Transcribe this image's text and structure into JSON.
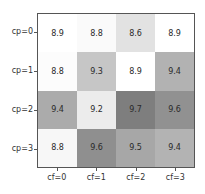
{
  "chart_data": {
    "type": "heatmap",
    "title": "",
    "xlabel": "",
    "ylabel": "",
    "x_categories": [
      "cf=0",
      "cf=1",
      "cf=2",
      "cf=3"
    ],
    "y_categories": [
      "cp=0",
      "cp=1",
      "cp=2",
      "cp=3"
    ],
    "values": [
      [
        8.9,
        8.8,
        8.6,
        8.9
      ],
      [
        8.8,
        9.3,
        8.9,
        9.4
      ],
      [
        9.4,
        9.2,
        9.7,
        9.6
      ],
      [
        8.8,
        9.6,
        9.5,
        9.4
      ]
    ],
    "labels": [
      [
        "8.9",
        "8.8",
        "8.6",
        "8.9"
      ],
      [
        "8.8",
        "9.3",
        "8.9",
        "9.4"
      ],
      [
        "9.4",
        "9.2",
        "9.7",
        "9.6"
      ],
      [
        "8.8",
        "9.6",
        "9.5",
        "9.4"
      ]
    ],
    "cell_colors": [
      [
        "#ffffff",
        "#fafafa",
        "#e2e2e2",
        "#ffffff"
      ],
      [
        "#fcfcfc",
        "#c6c6c6",
        "#ffffff",
        "#b2b2b2"
      ],
      [
        "#ababab",
        "#ececec",
        "#7e7e7e",
        "#919191"
      ],
      [
        "#f7f7f7",
        "#8f8f8f",
        "#a7a7a7",
        "#b3b3b3"
      ]
    ],
    "colormap": "grayscale",
    "grid": false,
    "legend": "none"
  }
}
